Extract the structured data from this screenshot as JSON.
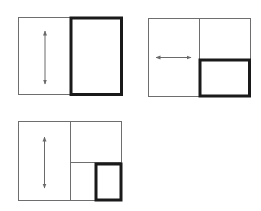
{
  "figure": {
    "colors": {
      "background": "#ffffff",
      "thin_line": "#6e6e6e",
      "thick_line": "#1a1a1a",
      "arrow": "#6a6a6a"
    },
    "panels": [
      {
        "id": "layout-1",
        "split": "vertical",
        "arrow_direction": "vertical",
        "active_pane": "right"
      },
      {
        "id": "layout-2",
        "split": "vertical-then-horizontal-right",
        "arrow_direction": "horizontal",
        "active_pane": "right-bottom"
      },
      {
        "id": "layout-3",
        "split": "vertical-then-horizontal-right-then-vertical-bottom",
        "arrow_direction": "vertical",
        "active_pane": "right-bottom-right"
      }
    ]
  }
}
